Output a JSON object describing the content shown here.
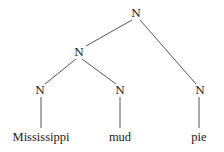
{
  "diagram": {
    "type": "syntax-tree",
    "nodes": {
      "root": {
        "label": "N"
      },
      "mid": {
        "label": "N"
      },
      "left": {
        "label": "N"
      },
      "center": {
        "label": "N"
      },
      "right": {
        "label": "N"
      }
    },
    "leaves": {
      "left": {
        "word": "Mississippi"
      },
      "center": {
        "word": "mud"
      },
      "right": {
        "word": "pie"
      }
    },
    "edges": [
      [
        "root",
        "mid"
      ],
      [
        "root",
        "right"
      ],
      [
        "mid",
        "left"
      ],
      [
        "mid",
        "center"
      ],
      [
        "left",
        "leaf-left"
      ],
      [
        "center",
        "leaf-center"
      ],
      [
        "right",
        "leaf-right"
      ]
    ],
    "colors": {
      "line": "#555555",
      "text": "#222222",
      "background": "#ffffff"
    }
  }
}
